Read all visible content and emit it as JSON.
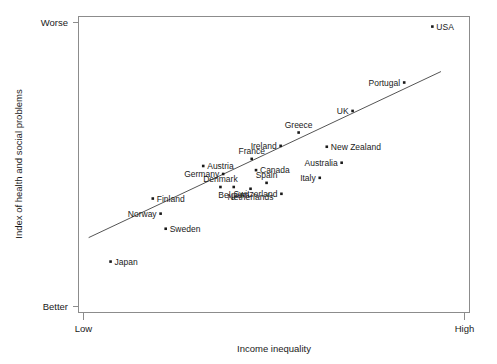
{
  "chart_data": {
    "type": "scatter",
    "title": "",
    "xlabel": "Income inequality",
    "ylabel": "Index of health and social problems",
    "xtick_labels": [
      "Low",
      "High"
    ],
    "ytick_labels": [
      "Worse",
      "Better"
    ],
    "grid": false,
    "legend": null,
    "axis_note": "Qualitative axes: x from Low to High income inequality; y from Better (bottom) to Worse (top) on the index of health and social problems.",
    "xlim": [
      0,
      1
    ],
    "ylim": [
      0,
      1
    ],
    "points": [
      {
        "label": "USA",
        "x": 0.905,
        "y": 0.966,
        "label_side": "right"
      },
      {
        "label": "Portugal",
        "x": 0.833,
        "y": 0.777,
        "label_side": "left"
      },
      {
        "label": "UK",
        "x": 0.701,
        "y": 0.681,
        "label_side": "left"
      },
      {
        "label": "Greece",
        "x": 0.563,
        "y": 0.608,
        "label_side": "above"
      },
      {
        "label": "New Zealand",
        "x": 0.635,
        "y": 0.56,
        "label_side": "right"
      },
      {
        "label": "Ireland",
        "x": 0.517,
        "y": 0.563,
        "label_side": "left"
      },
      {
        "label": "Australia",
        "x": 0.673,
        "y": 0.506,
        "label_side": "left"
      },
      {
        "label": "Italy",
        "x": 0.617,
        "y": 0.455,
        "label_side": "left"
      },
      {
        "label": "France",
        "x": 0.443,
        "y": 0.519,
        "label_side": "above"
      },
      {
        "label": "Austria",
        "x": 0.319,
        "y": 0.495,
        "label_side": "right"
      },
      {
        "label": "Germany",
        "x": 0.37,
        "y": 0.468,
        "label_side": "left"
      },
      {
        "label": "Canada",
        "x": 0.454,
        "y": 0.481,
        "label_side": "right"
      },
      {
        "label": "Denmark",
        "x": 0.363,
        "y": 0.424,
        "label_side": "above"
      },
      {
        "label": "Belgium",
        "x": 0.397,
        "y": 0.424,
        "label_side": "below"
      },
      {
        "label": "Spain",
        "x": 0.481,
        "y": 0.438,
        "label_side": "above"
      },
      {
        "label": "Switzerland",
        "x": 0.519,
        "y": 0.401,
        "label_side": "left"
      },
      {
        "label": "Netherlands",
        "x": 0.44,
        "y": 0.418,
        "label_side": "below"
      },
      {
        "label": "Finland",
        "x": 0.19,
        "y": 0.385,
        "label_side": "right"
      },
      {
        "label": "Norway",
        "x": 0.21,
        "y": 0.334,
        "label_side": "left"
      },
      {
        "label": "Sweden",
        "x": 0.223,
        "y": 0.283,
        "label_side": "right"
      },
      {
        "label": "Japan",
        "x": 0.082,
        "y": 0.172,
        "label_side": "right"
      }
    ],
    "trend_line": {
      "x_start": 0.026,
      "y_start": 0.253,
      "x_end": 0.927,
      "y_end": 0.814
    }
  },
  "colors": {
    "marker": "#1a1a1a",
    "trend_line": "#555555",
    "axis": "#8c8c8c",
    "text": "#1a1a1a",
    "background": "#ffffff"
  }
}
